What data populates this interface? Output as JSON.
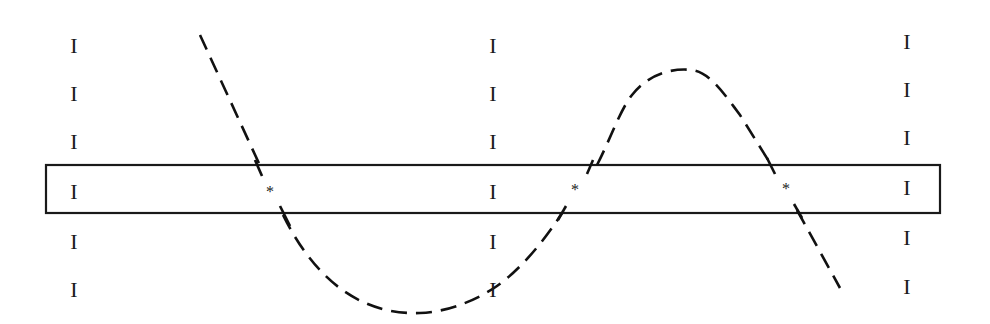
{
  "diagram": {
    "band": {
      "x": 46,
      "y": 165,
      "width": 894,
      "height": 48,
      "stroke": "#1a1a1a"
    },
    "columns": [
      {
        "x": 74,
        "marker": "I",
        "rows": [
          46,
          94,
          142,
          192,
          242,
          290
        ]
      },
      {
        "x": 493,
        "marker": "I",
        "rows": [
          46,
          94,
          142,
          192,
          242,
          290
        ]
      },
      {
        "x": 907,
        "marker": "I",
        "rows": [
          42,
          90,
          138,
          188,
          238,
          287
        ]
      }
    ],
    "crossings": [
      {
        "label": "*",
        "x": 270,
        "y": 192
      },
      {
        "label": "*",
        "x": 575,
        "y": 190
      },
      {
        "label": "*",
        "x": 786,
        "y": 189
      }
    ],
    "curve": {
      "style": "dashed",
      "color": "#111111",
      "path": "M200,35 L262,170 M283,215 C320,290 370,315 420,313 C450,312 480,298 497,286 C520,270 545,240 562,213 M597,165 C610,140 620,110 632,95 C650,72 675,68 692,70 C710,72 725,95 740,115 L770,163 M797,210 L840,288"
    },
    "band_crossing_ticks": [
      {
        "x1": 255,
        "y1": 160,
        "x2": 262,
        "y2": 176
      },
      {
        "x1": 280,
        "y1": 206,
        "x2": 290,
        "y2": 226
      },
      {
        "x1": 593,
        "y1": 160,
        "x2": 587,
        "y2": 174
      },
      {
        "x1": 566,
        "y1": 206,
        "x2": 558,
        "y2": 220
      },
      {
        "x1": 767,
        "y1": 158,
        "x2": 775,
        "y2": 174
      },
      {
        "x1": 794,
        "y1": 204,
        "x2": 802,
        "y2": 218
      }
    ]
  }
}
